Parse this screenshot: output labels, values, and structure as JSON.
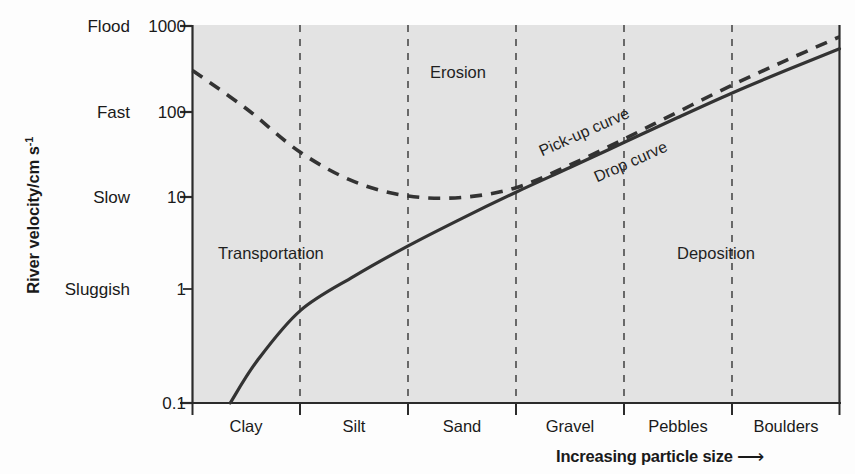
{
  "chart_data": {
    "type": "line",
    "title": "",
    "ylabel": "River velocity/cm s",
    "ylabel_exponent": "-1",
    "xlabel": "Increasing particle size",
    "xlabel_arrow": "⟶",
    "y_scale": "log",
    "ylim": [
      0.1,
      1000
    ],
    "y_ticks": [
      "1000",
      "100",
      "10",
      "1",
      "0.1"
    ],
    "y_word_ticks": [
      "Flood",
      "Fast",
      "Slow",
      "Sluggish"
    ],
    "y_word_values": [
      1000,
      100,
      10,
      1
    ],
    "x_categories": [
      "Clay",
      "Silt",
      "Sand",
      "Gravel",
      "Pebbles",
      "Boulders"
    ],
    "grid": "vertical dashed category dividers",
    "legend_position": "inline labels on curves",
    "plot_background": "#e3e3e3",
    "line_color": "#2b2b2b",
    "series": [
      {
        "name": "Pick-up curve",
        "style": "dashed",
        "points": [
          {
            "x": 0.0,
            "y": 330
          },
          {
            "x": 0.5,
            "y": 130
          },
          {
            "x": 1.0,
            "y": 45
          },
          {
            "x": 1.5,
            "y": 22
          },
          {
            "x": 2.0,
            "y": 15.5
          },
          {
            "x": 2.5,
            "y": 15
          },
          {
            "x": 3.0,
            "y": 19
          },
          {
            "x": 3.5,
            "y": 33
          },
          {
            "x": 4.0,
            "y": 62
          },
          {
            "x": 4.5,
            "y": 120
          },
          {
            "x": 5.0,
            "y": 230
          },
          {
            "x": 5.5,
            "y": 420
          },
          {
            "x": 6.0,
            "y": 750
          }
        ]
      },
      {
        "name": "Drop curve",
        "style": "solid",
        "points": [
          {
            "x": 0.35,
            "y": 0.1
          },
          {
            "x": 0.6,
            "y": 0.28
          },
          {
            "x": 1.0,
            "y": 0.95
          },
          {
            "x": 1.5,
            "y": 2.2
          },
          {
            "x": 2.0,
            "y": 4.6
          },
          {
            "x": 2.5,
            "y": 9.0
          },
          {
            "x": 3.0,
            "y": 17
          },
          {
            "x": 3.5,
            "y": 31
          },
          {
            "x": 4.0,
            "y": 57
          },
          {
            "x": 4.5,
            "y": 105
          },
          {
            "x": 5.0,
            "y": 190
          },
          {
            "x": 5.5,
            "y": 330
          },
          {
            "x": 6.0,
            "y": 560
          }
        ]
      }
    ],
    "region_labels": [
      {
        "text": "Erosion",
        "x": 2.2,
        "y": 330
      },
      {
        "text": "Transportation",
        "x": 0.55,
        "y": 3.1
      },
      {
        "text": "Deposition",
        "x": 4.55,
        "y": 3.1
      }
    ],
    "curve_labels": [
      {
        "text": "Pick-up curve",
        "angle": -24
      },
      {
        "text": "Drop curve",
        "angle": -24
      }
    ]
  },
  "axis": {
    "y_word_ticks": [
      {
        "label": "Flood"
      },
      {
        "label": "Fast"
      },
      {
        "label": "Slow"
      },
      {
        "label": "Sluggish"
      }
    ],
    "y_num_ticks": [
      {
        "label": "1000"
      },
      {
        "label": "100"
      },
      {
        "label": "10"
      },
      {
        "label": "1"
      },
      {
        "label": "0.1"
      }
    ],
    "x_categories": [
      {
        "label": "Clay"
      },
      {
        "label": "Silt"
      },
      {
        "label": "Sand"
      },
      {
        "label": "Gravel"
      },
      {
        "label": "Pebbles"
      },
      {
        "label": "Boulders"
      }
    ],
    "y_title_main": "River velocity/cm s",
    "y_title_sup": "-1",
    "x_title": "Increasing particle size",
    "x_title_arrow": "⟶"
  },
  "regions": {
    "erosion": "Erosion",
    "transportation": "Transportation",
    "deposition": "Deposition"
  },
  "curves": {
    "pickup": "Pick-up curve",
    "drop": "Drop curve"
  }
}
